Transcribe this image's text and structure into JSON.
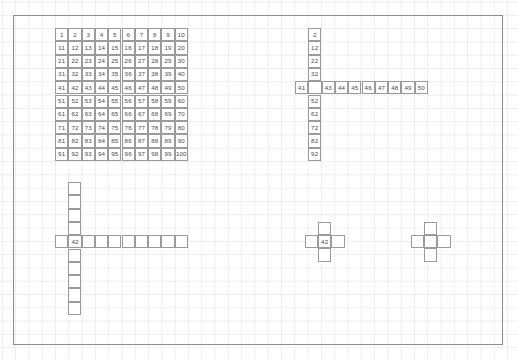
{
  "page": {
    "width": 518,
    "height": 360,
    "background_color": "#ffffff",
    "grid_line_color": "#ededf0",
    "border_color": "#8d8d93",
    "cell_border_color": "#9a9a9f",
    "text_color": "#4a4a4f",
    "cell_size": 13.3
  },
  "figures": [
    {
      "id": "hundred-chart",
      "name": "hundred-chart",
      "type": "full-grid",
      "origin": {
        "x": 55,
        "y": 28
      },
      "columns": 10,
      "rows": 10,
      "rows_values": [
        [
          "1",
          "2",
          "3",
          "4",
          "5",
          "6",
          "7",
          "8",
          "9",
          "10"
        ],
        [
          "11",
          "12",
          "13",
          "14",
          "15",
          "16",
          "17",
          "18",
          "19",
          "20"
        ],
        [
          "21",
          "22",
          "23",
          "24",
          "25",
          "26",
          "27",
          "28",
          "29",
          "30"
        ],
        [
          "31",
          "32",
          "33",
          "34",
          "35",
          "36",
          "37",
          "38",
          "39",
          "40"
        ],
        [
          "41",
          "42",
          "43",
          "44",
          "45",
          "46",
          "47",
          "48",
          "49",
          "50"
        ],
        [
          "51",
          "52",
          "53",
          "54",
          "55",
          "56",
          "57",
          "58",
          "59",
          "60"
        ],
        [
          "61",
          "62",
          "63",
          "64",
          "65",
          "66",
          "67",
          "68",
          "69",
          "70"
        ],
        [
          "71",
          "72",
          "73",
          "74",
          "75",
          "76",
          "77",
          "78",
          "79",
          "80"
        ],
        [
          "81",
          "82",
          "83",
          "84",
          "85",
          "86",
          "87",
          "88",
          "89",
          "90"
        ],
        [
          "91",
          "92",
          "93",
          "94",
          "95",
          "96",
          "97",
          "98",
          "99",
          "100"
        ]
      ]
    },
    {
      "id": "numbered-cross",
      "name": "numbered-cross-chart",
      "type": "cross",
      "column_origin": {
        "x": 308,
        "y": 28
      },
      "row_origin": {
        "x": 295,
        "y": 81
      },
      "column_values": [
        "2",
        "12",
        "22",
        "32",
        "",
        "52",
        "62",
        "72",
        "82",
        "92"
      ],
      "column_blank_index": 4,
      "row_values": [
        "41",
        "",
        "43",
        "44",
        "45",
        "46",
        "47",
        "48",
        "49",
        "50"
      ],
      "row_blank_index": 1,
      "intersection_index": {
        "column": 4,
        "row": 1
      }
    },
    {
      "id": "blank-cross-large",
      "name": "blank-cross-large",
      "type": "cross",
      "column_origin": {
        "x": 68,
        "y": 182
      },
      "row_origin": {
        "x": 55,
        "y": 235
      },
      "column_values": [
        "",
        "",
        "",
        "",
        "",
        "",
        "",
        "",
        "",
        ""
      ],
      "row_values": [
        "",
        "42",
        "",
        "",
        "",
        "",
        "",
        "",
        "",
        ""
      ],
      "intersection_index": {
        "column": 4,
        "row": 1
      },
      "center_label": "42"
    },
    {
      "id": "plus-labeled",
      "name": "plus-shape-labeled",
      "type": "plus",
      "center": {
        "x": 318,
        "y": 235
      },
      "center_label": "42"
    },
    {
      "id": "plus-blank",
      "name": "plus-shape-blank",
      "type": "plus",
      "center": {
        "x": 424,
        "y": 235
      },
      "center_label": ""
    }
  ]
}
